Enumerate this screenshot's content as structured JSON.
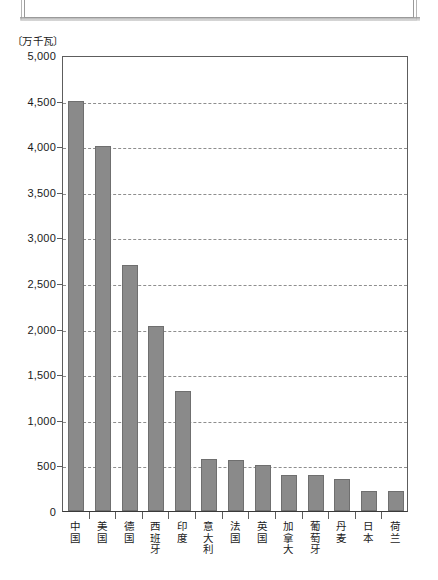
{
  "ornament": {
    "name": "top-cropped-frame"
  },
  "chart_data": {
    "type": "bar",
    "title": "",
    "subtitle": "",
    "xlabel": "",
    "ylabel": "",
    "unit_caption": "〔万千瓦〕",
    "grid": true,
    "legend": "none",
    "ylim": [
      0,
      5000
    ],
    "ytick_step": 500,
    "ytick_labels": [
      "5,000",
      "4,500",
      "4,000",
      "3,500",
      "3,000",
      "2,500",
      "2,000",
      "1,500",
      "1,000",
      "500",
      "0"
    ],
    "ytick_values": [
      5000,
      4500,
      4000,
      3500,
      3000,
      2500,
      2000,
      1500,
      1000,
      500,
      0
    ],
    "categories": [
      "中国",
      "美国",
      "德国",
      "西班牙",
      "印度",
      "意大利",
      "法国",
      "英国",
      "加拿大",
      "葡萄牙",
      "丹麦",
      "日本",
      "荷兰"
    ],
    "values": [
      4500,
      4000,
      2700,
      2030,
      1320,
      570,
      560,
      500,
      400,
      400,
      350,
      220,
      220
    ],
    "bar_color": "#8a8a8a",
    "gridline_color": "#8e8e8e",
    "axis_color": "#5d5d5d"
  }
}
